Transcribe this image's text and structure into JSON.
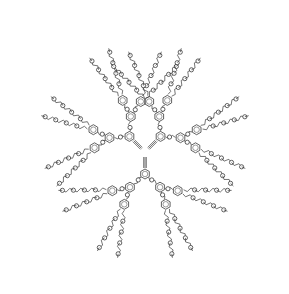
{
  "diagram": {
    "type": "chemical-structure",
    "core": {
      "label": "C≡C–CH=CH–C≡C",
      "center": [
        145,
        152
      ]
    },
    "atom_label": "O",
    "colors": {
      "bond": "#3a3a3a",
      "background": "#ffffff"
    },
    "branches": [
      {
        "name": "upper-left-dendron",
        "angle": -135
      },
      {
        "name": "upper-right-dendron",
        "angle": -45
      },
      {
        "name": "bottom-dendron",
        "angle": 90
      }
    ],
    "generations": 3,
    "terminal_chain_oxygens": 4
  }
}
